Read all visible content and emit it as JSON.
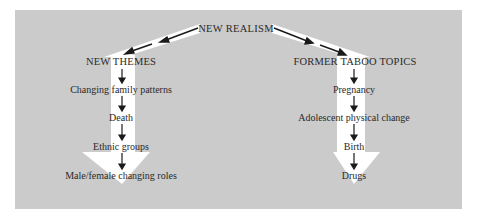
{
  "diagram": {
    "root": {
      "label": "NEW REALISM"
    },
    "branches": [
      {
        "heading": "NEW THEMES",
        "items": [
          "Changing family patterns",
          "Death",
          "Ethnic groups",
          "Male/female changing roles"
        ]
      },
      {
        "heading": "FORMER TABOO TOPICS",
        "items": [
          "Pregnancy",
          "Adolescent physical change",
          "Birth",
          "Drugs"
        ]
      }
    ],
    "colors": {
      "background": "#cbcbcb",
      "band_arrow": "#ffffff",
      "line_arrow": "#1a1a1a",
      "text": "#2a2a2a"
    }
  }
}
